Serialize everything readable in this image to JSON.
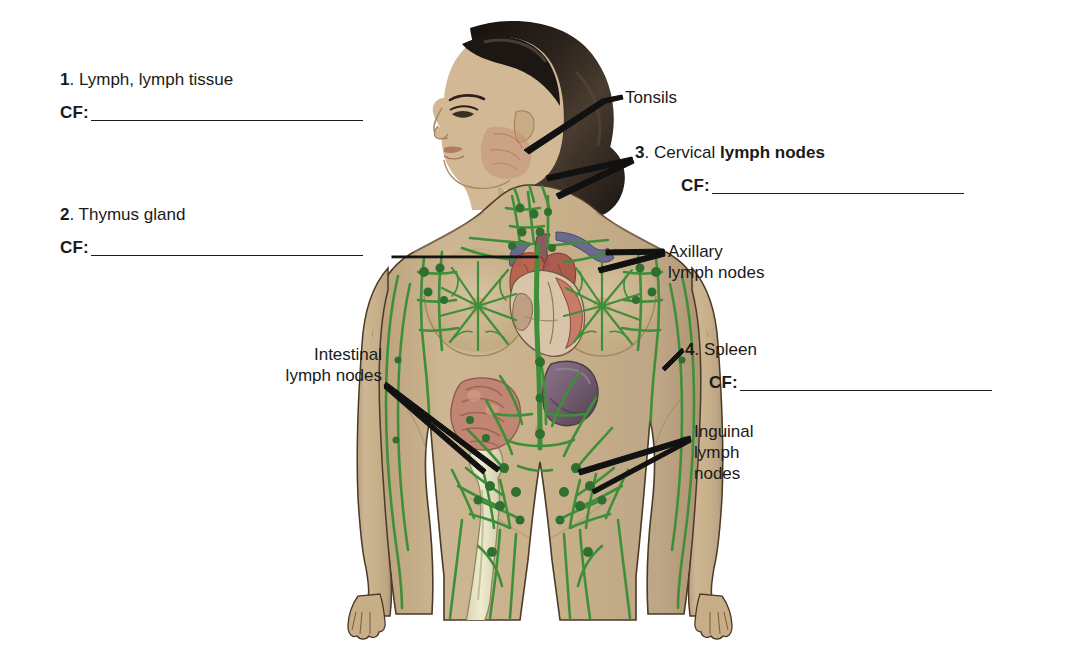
{
  "page": {
    "background": "#ffffff",
    "width": 1071,
    "height": 650
  },
  "palette": {
    "skin": "#c8b08a",
    "skin_shadow": "#b49b74",
    "skin_light": "#d8c5a4",
    "lymph_green": "#3f8f3a",
    "lymph_green_dark": "#2f7030",
    "hair": "#221c18",
    "hair_light": "#5a4a3c",
    "spleen": "#7b6478",
    "spleen_dark": "#5d4a5c",
    "bone": "#e8e4c8",
    "intestine": "#c08573",
    "heart_red": "#9c4236",
    "vessel_blue": "#6a6a8c",
    "outline": "#3a2f24",
    "text": "#1a1a1a",
    "rule": "#1c1c1c"
  },
  "questions": [
    {
      "number": "1",
      "number_suffix": ".",
      "term_plain": " Lymph, lymph tissue",
      "term_bold": "",
      "cf_label": "CF:",
      "cf_value": "",
      "left": 60,
      "top": 70,
      "rule_width": 272
    },
    {
      "number": "2",
      "number_suffix": ".",
      "term_plain": " Thymus gland",
      "term_bold": "",
      "cf_label": "CF:",
      "cf_value": "",
      "left": 60,
      "top": 205,
      "rule_width": 272
    },
    {
      "number": "3",
      "number_suffix": ".",
      "term_plain": " Cervical ",
      "term_bold": "lymph nodes",
      "cf_label": "CF:",
      "cf_value": "",
      "left": 635,
      "top": 143,
      "rule_width": 252
    },
    {
      "number": "4",
      "number_suffix": ".",
      "term_plain": " Spleen",
      "term_bold": "",
      "cf_label": "CF:",
      "cf_value": "",
      "left": 685,
      "top": 340,
      "rule_width": 252
    }
  ],
  "callouts": [
    {
      "name": "tonsils",
      "lines": [
        "Tonsils"
      ],
      "left": 625,
      "top": 87,
      "align": "left"
    },
    {
      "name": "axillary-lymph-nodes",
      "lines": [
        "Axillary",
        "lymph nodes"
      ],
      "left": 668,
      "top": 241,
      "align": "left"
    },
    {
      "name": "intestinal-lymph-nodes",
      "lines": [
        "Intestinal",
        "lymph nodes"
      ],
      "left": 266,
      "top": 344,
      "align": "right",
      "width": 116
    },
    {
      "name": "inguinal-lymph-nodes",
      "lines": [
        "Inguinal",
        "lymph",
        "nodes"
      ],
      "left": 694,
      "top": 421,
      "align": "left"
    }
  ],
  "figure": {
    "structures": [
      "tonsils",
      "cervical lymph nodes",
      "thymus gland",
      "heart",
      "axillary lymph nodes",
      "breast lymphatic plexus",
      "spleen",
      "intestinal lymph nodes",
      "inguinal lymph nodes",
      "femur",
      "lymphatic vessels"
    ]
  }
}
